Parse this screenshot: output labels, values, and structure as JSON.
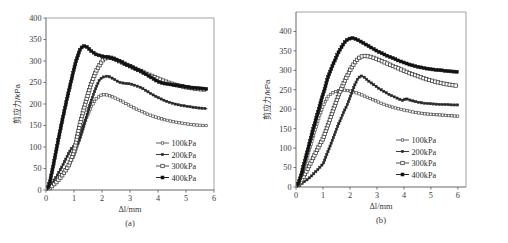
{
  "figure": {
    "panels": [
      {
        "id": "a",
        "panel_label": "(a)",
        "xlabel": "Δl/mm",
        "ylabel": "剪应力/kPa"
      },
      {
        "id": "b",
        "panel_label": "(b)",
        "xlabel": "Δl/mm",
        "ylabel": "剪应力/kPa"
      }
    ]
  },
  "chart_data": [
    {
      "type": "line",
      "title": "",
      "panel": "(a)",
      "xlabel": "Δl/mm",
      "ylabel": "剪应力/kPa",
      "xlim": [
        0,
        6
      ],
      "ylim": [
        0,
        400
      ],
      "xticks": [
        0,
        1,
        2,
        3,
        4,
        5,
        6
      ],
      "yticks": [
        0,
        50,
        100,
        150,
        200,
        250,
        300,
        350,
        400
      ],
      "xtick_labels": [
        "0",
        "1",
        "2",
        "3",
        "4",
        "5",
        "6"
      ],
      "ytick_labels": [
        "0",
        "50",
        "100",
        "150",
        "200",
        "250",
        "300",
        "350",
        "400"
      ],
      "grid": false,
      "legend_position": "lower-right",
      "series": [
        {
          "name": "100kPa",
          "marker": "open-square-small",
          "color": "#4a4a4a",
          "x": [
            0.05,
            0.2,
            0.4,
            0.6,
            0.8,
            1.0,
            1.2,
            1.4,
            1.6,
            1.8,
            2.0,
            2.2,
            2.4,
            2.6,
            2.8,
            3.0,
            3.2,
            3.4,
            3.6,
            3.8,
            4.0,
            4.2,
            4.4,
            4.6,
            4.8,
            5.0,
            5.2,
            5.4,
            5.6,
            5.75
          ],
          "y": [
            0,
            10,
            22,
            38,
            57,
            80,
            120,
            160,
            192,
            213,
            222,
            221,
            216,
            210,
            203,
            196,
            189,
            183,
            177,
            172,
            168,
            164,
            161,
            158,
            156,
            154,
            152,
            151,
            150,
            150
          ]
        },
        {
          "name": "200kPa",
          "marker": "filled-square-small",
          "color": "#262626",
          "x": [
            0.05,
            0.2,
            0.4,
            0.6,
            0.8,
            0.9,
            1.0,
            1.1,
            1.2,
            1.4,
            1.6,
            1.8,
            1.9,
            2.0,
            2.2,
            2.4,
            2.6,
            2.8,
            3.0,
            3.2,
            3.4,
            3.6,
            3.8,
            4.0,
            4.2,
            4.4,
            4.6,
            4.8,
            5.0,
            5.2,
            5.4,
            5.6,
            5.75
          ],
          "y": [
            0,
            14,
            34,
            58,
            84,
            96,
            102,
            104,
            118,
            160,
            205,
            240,
            255,
            262,
            265,
            259,
            251,
            248,
            247,
            243,
            238,
            230,
            222,
            215,
            209,
            204,
            200,
            197,
            195,
            193,
            191,
            190,
            189
          ]
        },
        {
          "name": "300kPa",
          "marker": "open-square",
          "color": "#3a3a3a",
          "x": [
            0.05,
            0.2,
            0.4,
            0.6,
            0.8,
            0.9,
            1.0,
            1.05,
            1.2,
            1.4,
            1.6,
            1.8,
            2.0,
            2.1,
            2.2,
            2.3,
            2.4,
            2.6,
            2.8,
            3.0,
            3.2,
            3.4,
            3.6,
            3.8,
            4.0,
            4.2,
            4.4,
            4.6,
            4.8,
            5.0,
            5.2,
            5.4,
            5.6,
            5.75
          ],
          "y": [
            0,
            8,
            20,
            36,
            56,
            72,
            90,
            104,
            150,
            200,
            245,
            278,
            300,
            306,
            308,
            308,
            306,
            300,
            294,
            288,
            282,
            276,
            270,
            265,
            259,
            254,
            249,
            245,
            242,
            239,
            237,
            235,
            234,
            233
          ]
        },
        {
          "name": "400kPa",
          "marker": "filled-square",
          "color": "#111111",
          "x": [
            0.05,
            0.15,
            0.3,
            0.45,
            0.6,
            0.75,
            0.9,
            1.0,
            1.1,
            1.2,
            1.3,
            1.4,
            1.5,
            1.6,
            1.8,
            2.0,
            2.2,
            2.4,
            2.6,
            2.8,
            3.0,
            3.2,
            3.4,
            3.6,
            3.8,
            4.0,
            4.2,
            4.4,
            4.6,
            4.8,
            5.0,
            5.2,
            5.4,
            5.6,
            5.75
          ],
          "y": [
            0,
            22,
            70,
            120,
            168,
            212,
            254,
            282,
            305,
            325,
            334,
            335,
            331,
            324,
            315,
            311,
            309,
            306,
            301,
            294,
            288,
            282,
            276,
            268,
            260,
            252,
            248,
            246,
            244,
            242,
            240,
            238,
            237,
            236,
            235
          ]
        }
      ]
    },
    {
      "type": "line",
      "title": "",
      "panel": "(b)",
      "xlabel": "Δl/mm",
      "ylabel": "剪应力/kPa",
      "xlim": [
        0,
        6.3
      ],
      "ylim": [
        0,
        450
      ],
      "xticks": [
        0,
        1,
        2,
        3,
        4,
        5,
        6
      ],
      "yticks": [
        0,
        50,
        100,
        150,
        200,
        250,
        300,
        350,
        400
      ],
      "xtick_labels": [
        "0",
        "1",
        "2",
        "3",
        "4",
        "5",
        "6"
      ],
      "ytick_labels": [
        "0",
        "50",
        "100",
        "150",
        "200",
        "250",
        "300",
        "350",
        "400"
      ],
      "grid": false,
      "legend_position": "lower-right",
      "series": [
        {
          "name": "100kPa",
          "marker": "open-square-small",
          "color": "#4a4a4a",
          "x": [
            0.05,
            0.2,
            0.4,
            0.6,
            0.8,
            1.0,
            1.2,
            1.4,
            1.6,
            1.8,
            2.0,
            2.2,
            2.4,
            2.6,
            2.8,
            3.0,
            3.2,
            3.4,
            3.6,
            3.8,
            4.0,
            4.2,
            4.4,
            4.6,
            4.8,
            5.0,
            5.2,
            5.4,
            5.6,
            5.8,
            6.0
          ],
          "y": [
            0,
            28,
            72,
            120,
            168,
            208,
            234,
            244,
            248,
            249,
            247,
            243,
            238,
            232,
            226,
            220,
            214,
            209,
            205,
            201,
            198,
            195,
            192,
            190,
            188,
            187,
            186,
            185,
            184,
            183,
            182
          ]
        },
        {
          "name": "200kPa",
          "marker": "filled-square-small",
          "color": "#262626",
          "x": [
            0.05,
            0.2,
            0.4,
            0.6,
            0.8,
            0.9,
            0.95,
            1.0,
            1.1,
            1.3,
            1.5,
            1.7,
            1.9,
            2.0,
            2.1,
            2.2,
            2.3,
            2.4,
            2.5,
            2.7,
            2.9,
            3.1,
            3.3,
            3.5,
            3.7,
            3.9,
            4.0,
            4.05,
            4.2,
            4.4,
            4.6,
            4.8,
            5.0,
            5.2,
            5.4,
            5.6,
            5.8,
            6.0
          ],
          "y": [
            0,
            8,
            18,
            30,
            44,
            52,
            56,
            58,
            76,
            112,
            148,
            182,
            212,
            230,
            248,
            266,
            280,
            286,
            284,
            272,
            262,
            252,
            244,
            236,
            230,
            224,
            222,
            228,
            224,
            220,
            217,
            215,
            214,
            213,
            212,
            212,
            211,
            211
          ]
        },
        {
          "name": "300kPa",
          "marker": "open-square",
          "color": "#3a3a3a",
          "x": [
            0.05,
            0.2,
            0.4,
            0.6,
            0.8,
            1.0,
            1.2,
            1.4,
            1.6,
            1.8,
            2.0,
            2.1,
            2.2,
            2.3,
            2.4,
            2.5,
            2.6,
            2.8,
            3.0,
            3.2,
            3.4,
            3.6,
            3.8,
            4.0,
            4.2,
            4.4,
            4.6,
            4.8,
            5.0,
            5.2,
            5.4,
            5.6,
            5.8,
            6.0
          ],
          "y": [
            0,
            16,
            42,
            70,
            98,
            124,
            162,
            202,
            240,
            272,
            300,
            312,
            322,
            330,
            335,
            337,
            337,
            334,
            329,
            323,
            317,
            311,
            305,
            299,
            293,
            288,
            283,
            278,
            274,
            270,
            267,
            264,
            262,
            260
          ]
        },
        {
          "name": "400kPa",
          "marker": "filled-square",
          "color": "#111111",
          "x": [
            0.05,
            0.2,
            0.4,
            0.6,
            0.8,
            1.0,
            1.2,
            1.4,
            1.6,
            1.8,
            1.9,
            2.0,
            2.1,
            2.2,
            2.4,
            2.6,
            2.8,
            3.0,
            3.2,
            3.4,
            3.6,
            3.8,
            4.0,
            4.2,
            4.4,
            4.6,
            4.8,
            5.0,
            5.2,
            5.4,
            5.6,
            5.8,
            6.0
          ],
          "y": [
            0,
            34,
            86,
            140,
            190,
            238,
            285,
            320,
            350,
            372,
            379,
            382,
            383,
            381,
            374,
            366,
            358,
            350,
            343,
            337,
            331,
            325,
            320,
            315,
            311,
            308,
            305,
            303,
            301,
            300,
            298,
            297,
            296
          ]
        }
      ]
    }
  ]
}
